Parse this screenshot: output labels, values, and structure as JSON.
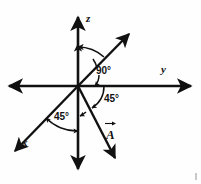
{
  "figure": {
    "background_color": "#fefefe",
    "stroke_color": "#111111",
    "width": 201,
    "height": 184
  },
  "axes": [
    {
      "name": "x",
      "label": "x",
      "direction": "down-left",
      "label_x": 22,
      "label_y": 140
    },
    {
      "name": "y",
      "label": "y",
      "direction": "right",
      "label_x": 161,
      "label_y": 69
    },
    {
      "name": "z",
      "label": "z",
      "direction": "up",
      "label_x": 86,
      "label_y": 13
    }
  ],
  "vector": {
    "name": "A",
    "label": "A",
    "has_overbar_arrow": true,
    "direction": "down-right",
    "label_x": 106,
    "label_y": 128
  },
  "angles": [
    {
      "name": "angle-z-to-diagonal",
      "label": "90°",
      "value": 90,
      "unit": "degrees",
      "label_x": 96,
      "label_y": 72,
      "between": [
        "z-axis",
        "upper-right-diagonal"
      ]
    },
    {
      "name": "angle-vector-to-y",
      "label": "45°",
      "value": 45,
      "unit": "degrees",
      "label_x": 106,
      "label_y": 97,
      "between": [
        "vector-A",
        "y-axis"
      ]
    },
    {
      "name": "angle-x-to-negative-z",
      "label": "45°",
      "value": 45,
      "unit": "degrees",
      "label_x": 55,
      "label_y": 114,
      "between": [
        "x-axis",
        "negative-z-axis"
      ]
    }
  ],
  "geometry": {
    "origin": {
      "x": 78,
      "y": 86
    },
    "z_axis": {
      "x1": 78,
      "y1": 14,
      "x2": 78,
      "y2": 172
    },
    "y_axis": {
      "x1": 6,
      "y1": 86,
      "x2": 194,
      "y2": 86
    },
    "x_axis": {
      "x1": 12,
      "y1": 154,
      "x2": 78,
      "y2": 86
    },
    "upper_diagonal": {
      "x1": 78,
      "y1": 86,
      "x2": 132,
      "y2": 31
    },
    "vector_a": {
      "x1": 78,
      "y1": 86,
      "x2": 117,
      "y2": 162
    }
  }
}
